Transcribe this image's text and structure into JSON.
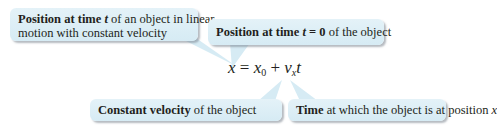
{
  "callouts": {
    "position_t": {
      "bold": "Position at time ",
      "var": "t",
      "rest_line1": " of an object in linear",
      "line2": "motion with constant velocity"
    },
    "position_0": {
      "bold": "Position at time ",
      "var": "t",
      "bold2": " = 0",
      "rest": " of the object"
    },
    "velocity": {
      "bold": "Constant velocity",
      "rest": " of the object"
    },
    "time": {
      "bold": "Time",
      "rest": " at which the object is at position ",
      "var": "x"
    }
  },
  "equation": {
    "lhs": "x",
    "equals": " = ",
    "term1": "x",
    "term1_sub": "0",
    "plus": " + ",
    "term2": "v",
    "term2_sub": "x",
    "term3": "t"
  },
  "colors": {
    "bubble_fill": "#dcedf5",
    "text": "#231f20"
  }
}
